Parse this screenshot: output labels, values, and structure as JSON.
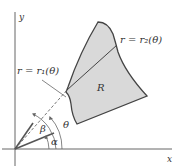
{
  "diagram": {
    "colors": {
      "axis": "#555555",
      "region_fill": "#d9d9d9",
      "region_stroke": "#444444",
      "text": "#333333",
      "ray": "#555555"
    },
    "axes": {
      "x_label": "x",
      "y_label": "y"
    },
    "region": {
      "label": "R"
    },
    "curves": {
      "inner_label": "r = r₁(θ)",
      "outer_label": "r = r₂(θ)"
    },
    "angles": {
      "alpha": "α",
      "beta": "β",
      "theta": "θ"
    }
  }
}
